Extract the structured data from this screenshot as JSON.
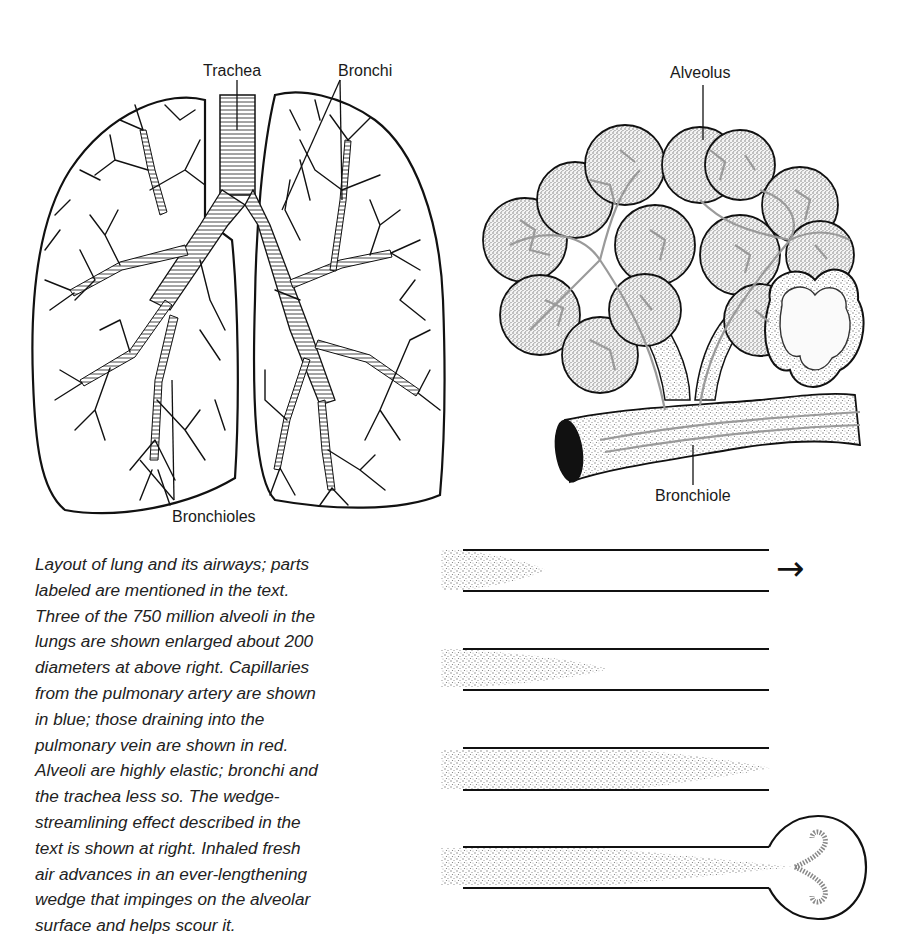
{
  "lung_diagram": {
    "labels": {
      "trachea": "Trachea",
      "bronchi": "Bronchi",
      "bronchioles": "Bronchioles"
    }
  },
  "alveoli_diagram": {
    "labels": {
      "alveolus": "Alveolus",
      "bronchiole": "Bronchiole"
    }
  },
  "caption": {
    "lines": [
      "Layout of lung and its airways; parts",
      "labeled are mentioned in the text.",
      "Three of the 750 million alveoli in the",
      "lungs are shown enlarged about 200",
      "diameters at above right. Capillaries",
      "from the pulmonary artery are shown",
      "in blue; those draining into the",
      "pulmonary vein are shown in red.",
      "Alveoli are highly elastic; bronchi and",
      "the trachea less so. The wedge-",
      "streamlining effect described in the",
      "text is shown at right. Inhaled fresh",
      "air advances in an ever-lengthening",
      "wedge that impinges on the alveolar",
      "surface and helps scour it."
    ]
  },
  "wedge_diagram": {
    "direction_arrow": "→",
    "stages": [
      {
        "stage": 1,
        "wedge_length_fraction": 0.3
      },
      {
        "stage": 2,
        "wedge_length_fraction": 0.5
      },
      {
        "stage": 3,
        "wedge_length_fraction": 1.0
      },
      {
        "stage": 4,
        "wedge_length_fraction": 1.0,
        "ends_in_alveolus": true
      }
    ]
  },
  "colors": {
    "ink": "#1a1a1a",
    "stipple": "#8a8a8a",
    "capillary": "#9a9a9a",
    "background": "#ffffff"
  }
}
